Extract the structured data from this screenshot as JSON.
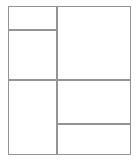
{
  "diagram": {
    "type": "grid-wireframe",
    "background_color": "#ffffff",
    "line_color": "#8a8a8a",
    "line_width_px": 1,
    "frame": {
      "label": "outer-frame",
      "x": 8,
      "y": 6,
      "width": 123,
      "height": 149
    },
    "columns": [
      {
        "name": "left-column",
        "x": 8,
        "width": 49
      },
      {
        "name": "right-column",
        "x": 57,
        "width": 74
      }
    ],
    "dividers": [
      {
        "name": "vertical-main-divider",
        "orientation": "vertical",
        "position": 57,
        "from": 6,
        "to": 155
      },
      {
        "name": "horizontal-left-upper-divider",
        "orientation": "horizontal",
        "position": 30,
        "from": 8,
        "to": 57
      },
      {
        "name": "horizontal-middle-divider",
        "orientation": "horizontal",
        "position": 80,
        "from": 8,
        "to": 131
      },
      {
        "name": "horizontal-right-lower-divider",
        "orientation": "horizontal",
        "position": 124,
        "from": 57,
        "to": 131
      }
    ],
    "cells": [
      {
        "name": "top-left-cell",
        "label": "",
        "x": 8,
        "y": 6,
        "width": 49,
        "height": 24
      },
      {
        "name": "mid-left-cell",
        "label": "",
        "x": 8,
        "y": 30,
        "width": 49,
        "height": 50
      },
      {
        "name": "bottom-left-cell",
        "label": "",
        "x": 8,
        "y": 80,
        "width": 49,
        "height": 75
      },
      {
        "name": "top-right-cell",
        "label": "",
        "x": 57,
        "y": 6,
        "width": 74,
        "height": 74
      },
      {
        "name": "mid-right-cell",
        "label": "",
        "x": 57,
        "y": 80,
        "width": 74,
        "height": 44
      },
      {
        "name": "bottom-right-cell",
        "label": "",
        "x": 57,
        "y": 124,
        "width": 74,
        "height": 31
      }
    ]
  }
}
